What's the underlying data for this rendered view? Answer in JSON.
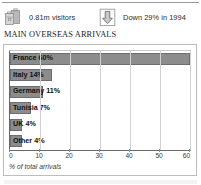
{
  "stats": [
    {
      "icon": "suitcase-luggage-icon",
      "label": "0.81m visitors"
    },
    {
      "icon": "down-arrow-icon",
      "label": "Down 29% in 1994"
    }
  ],
  "section_title": "MAIN OVERSEAS ARRIVALS",
  "colors": {
    "bar_fill": "#8c8c8c",
    "bar_stroke": "#6e6e6e",
    "grid": "#d2d2d2",
    "axis": "#6a6a6a",
    "frame": "#bdbdbd"
  },
  "chart_data": {
    "type": "bar",
    "orientation": "horizontal",
    "title": "MAIN OVERSEAS ARRIVALS",
    "xlabel": "% of total arrivals",
    "ylabel": "",
    "categories": [
      "France",
      "Italy",
      "Germany",
      "Tunisia",
      "UK",
      "Other"
    ],
    "values": [
      60,
      14,
      11,
      7,
      4,
      4
    ],
    "bar_labels": [
      "France 60%",
      "Italy 14%",
      "Germany 11%",
      "Tunisia 7%",
      "UK 4%",
      "Other 4%"
    ],
    "xlim": [
      0,
      60
    ],
    "xticks": [
      0,
      10,
      20,
      30,
      40,
      50,
      60
    ],
    "xtick_labels": [
      "0",
      "10",
      "20",
      "30",
      "40",
      "50",
      "60"
    ],
    "grid": true,
    "grid_axis": "x",
    "legend": false
  }
}
